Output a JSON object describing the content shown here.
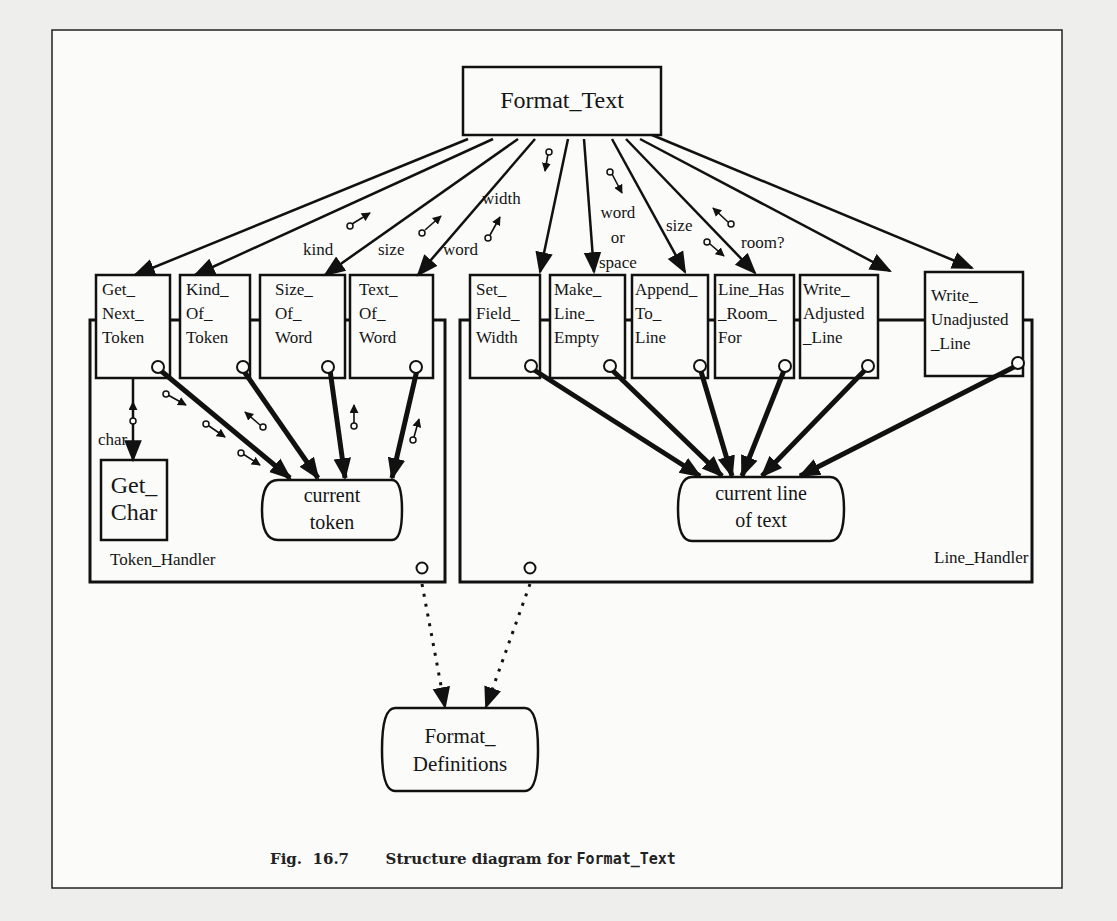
{
  "figure": {
    "top_module": "Format_Text",
    "modules_left": [
      {
        "name": "Get_Next_Token",
        "lines": "Get_\nNext_\nToken"
      },
      {
        "name": "Kind_Of_Token",
        "lines": "Kind_\nOf_\nToken"
      },
      {
        "name": "Size_Of_Word",
        "lines": "Size_\nOf_\nWord"
      },
      {
        "name": "Text_Of_Word",
        "lines": "Text_\nOf_\nWord"
      }
    ],
    "modules_right": [
      {
        "name": "Set_Field_Width",
        "lines": "Set_\nField_\nWidth"
      },
      {
        "name": "Make_Line_Empty",
        "lines": "Make_\nLine_\nEmpty"
      },
      {
        "name": "Append_To_Line",
        "lines": "Append_\nTo_\nLine"
      },
      {
        "name": "Line_Has_Room_For",
        "lines": "Line_Has\n_Room_\nFor"
      },
      {
        "name": "Write_Adjusted_Line",
        "lines": "Write_\nAdjusted\n_Line"
      },
      {
        "name": "Write_Unadjusted_Line",
        "lines": "Write_\nUnadjusted\n_Line"
      }
    ],
    "sub_module": "Get_\nChar",
    "data_stores": {
      "current_token": "current\ntoken",
      "current_line": "current line\nof text",
      "format_definitions": "Format_\nDefinitions"
    },
    "packages": {
      "token_handler": "Token_Handler",
      "line_handler": "Line_Handler"
    },
    "flow_labels": {
      "kind": "kind",
      "size_left": "size",
      "word": "word",
      "width": "width",
      "word_or_space": "word\nor\nspace",
      "size_right": "size",
      "room": "room?",
      "char": "char"
    },
    "caption": {
      "fig": "Fig.  16.7",
      "text": "Structure diagram for ",
      "code": "Format_Text"
    }
  }
}
